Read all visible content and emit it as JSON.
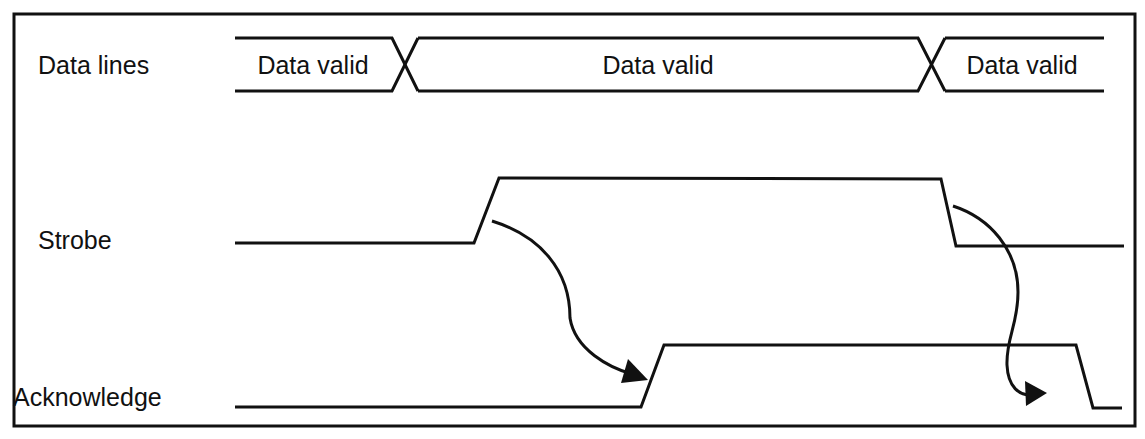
{
  "colors": {
    "stroke": "#111111",
    "background": "#ffffff"
  },
  "signals": [
    {
      "id": "data",
      "label": "Data lines"
    },
    {
      "id": "strobe",
      "label": "Strobe"
    },
    {
      "id": "ack",
      "label": "Acknowledge"
    }
  ],
  "data_segments": [
    {
      "label": "Data valid"
    },
    {
      "label": "Data valid"
    },
    {
      "label": "Data valid"
    }
  ],
  "arrows": [
    {
      "from": "strobe-rising-edge",
      "to": "acknowledge-rising-edge"
    },
    {
      "from": "strobe-falling-edge",
      "to": "acknowledge-falling-edge"
    }
  ]
}
